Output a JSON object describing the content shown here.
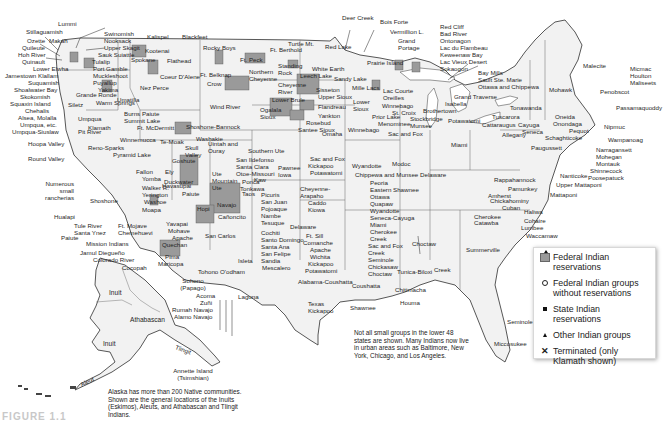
{
  "map": {
    "title": "Native American groups in the United States",
    "legend": {
      "items": [
        {
          "symbol": "federal-reservation-shaded-icon",
          "label": "Federal Indian reservations"
        },
        {
          "symbol": "open-circle-icon",
          "label": "Federal Indian groups without reservations"
        },
        {
          "symbol": "filled-square-icon",
          "label": "State Indian reservations"
        },
        {
          "symbol": "triangle-icon",
          "label": "Other Indian groups"
        },
        {
          "symbol": "x-mark-icon",
          "label": "Terminated (only Klamath shown)"
        }
      ]
    },
    "notes": {
      "lower48": "Not all small groups in the lower 48 states are shown. Many Indians now live in urban areas such as Baltimore, New York, Chicago, and Los Angeles.",
      "alaska": "Alaska has more than 200 Native communities. Shown are the general locations of the Inuits (Eskimos), Aleuts, and Athabascan and Tlingit Indians."
    },
    "figure_label": "FIGURE 1.1",
    "colors": {
      "land": "#f2f2f2",
      "reservation": "#9a9a9a",
      "border": "#555555",
      "text": "#1f1f1f"
    },
    "labels": {
      "northwest": [
        "Lummi",
        "Stillaguamish",
        "Ozette",
        "Makah",
        "Quileute",
        "Hoh River",
        "Quinault",
        "Lower Elwha",
        "Jamestown Klallam",
        "Suquamish",
        "Shoalwater Bay",
        "Skokomish",
        "Squaxin Island",
        "Chehalis",
        "Alsea, Molalla",
        "Umpqua, etc.",
        "Umpqua-Siuslaw",
        "Swinomish",
        "Nooksack",
        "Upper Skagit",
        "Sauk Suiattle",
        "Tulalip",
        "Port Gamble",
        "Muckleshoot",
        "Puyallup",
        "Yakima",
        "Grande Ronde",
        "Warm Springs",
        "Siletz",
        "Umatilla",
        "Nez Perce",
        "Kalispel",
        "Kootenai",
        "Spokane",
        "Flathead",
        "Coeur D'Alene",
        "Colville",
        "Burns Paiute",
        "Summit Lake",
        "Ft. McDermitt",
        "Klamath",
        "Pit River",
        "Umpqua"
      ],
      "california": [
        "Hoopa Valley",
        "Round Valley",
        "Numerous small rancherias",
        "Hualapi",
        "Tule River",
        "Santa Ynez",
        "Paiute",
        "Mission Indians",
        "Jamul Diegueño",
        "Colorado River",
        "Cocopah",
        "Shoshone",
        "Reno-Sparks",
        "Pyramid Lake",
        "Winnemucca",
        "Te-Moak",
        "Paiute",
        "Fallon",
        "Yomba",
        "Walker R.",
        "Yerington",
        "Washoe",
        "Ft. Mojave",
        "Chemehuevi",
        "Duckwater",
        "Ely",
        "Goshute"
      ],
      "southwest": [
        "Moapa",
        "Kaibab",
        "Havasupai",
        "Yavapai",
        "Mohave",
        "Apache",
        "Quechan",
        "Pima",
        "Maricopa",
        "Tohono O'odham",
        "Sohono (Papago)",
        "San Carlos",
        "Hopi",
        "Navajo",
        "Cañoncito",
        "Acoma",
        "Zuñi",
        "Rumah Navajo",
        "Alamo Navajo",
        "Laguna",
        "Isleta",
        "Mescalero",
        "Sandia",
        "San Felipe",
        "Santa Ana",
        "Santo Domingo",
        "Cochiti",
        "Tesuque",
        "Nambe",
        "Pojoaque",
        "San Juan",
        "Picuris",
        "Taos",
        "Santa Clara",
        "San Ildefonso",
        "Southern Ute",
        "Ute Mountain Ute",
        "Uintah and Ouray",
        "Skull Valley",
        "Paiute",
        "Shoshone-Bannock",
        "Washakie",
        "Wind River",
        "Jicarilla Apache"
      ],
      "plains": [
        "Blackfeet",
        "Rocky Boys",
        "Ft. Belknap",
        "Ft. Peck",
        "Crow",
        "Northern Cheyenne",
        "Ft. Berthold",
        "Turtle Mt.",
        "Standing Rock",
        "Cheyenne River",
        "Lower Brule",
        "Crow Creek",
        "Ogalala Sioux",
        "Rosebud",
        "Santee Sioux",
        "Flandreau",
        "Yankton",
        "Omaha",
        "Winnebago",
        "Sisseton",
        "Upper Sioux",
        "Lower Sioux",
        "Leech Lake",
        "White Earth",
        "Red Lake",
        "Sandy Lake",
        "Mille Lacs",
        "Otoe-Missouri",
        "Kaw",
        "Ponca",
        "Tonkawa",
        "Pawnee",
        "Iowa",
        "Sac and Fox",
        "Kickapoo",
        "Potawatomi",
        "Cheyenne-Arapaho",
        "Caddo",
        "Kiowa",
        "Delaware",
        "Ft. Sill",
        "Comanche",
        "Apache",
        "Wichita",
        "Kickapoo",
        "Potawatomi",
        "Texas Kickapoo",
        "Alabama-Coushatta"
      ],
      "great_lakes": [
        "Deer Creek",
        "Bois Forte",
        "Vermillion L.",
        "Grand Portage",
        "Prairie Island",
        "Red Cliff",
        "Bad River",
        "Ontonagon",
        "Lac du Flambeau",
        "Keweenaw Bay",
        "Lac Vieux Desert",
        "Sokaogon",
        "Bay Mills",
        "Sault Ste. Marie",
        "Ottawa and Chippewa",
        "Grand Traverse",
        "Isabella",
        "Potawatomi",
        "Lac Courte Oreilles",
        "Winnebago",
        "St. Croix",
        "Prior Lake",
        "Menominee",
        "Stockbridge Munsee",
        "Brothertown",
        "Sac and Fox",
        "Miami",
        "Wyandotte",
        "Chippewa and Munsee Delaware",
        "Peoria",
        "Eastern Shawnee",
        "Ottawa",
        "Quapaw",
        "Wyandotte",
        "Seneca-Cayuga",
        "Miami",
        "Cherokee",
        "Creek",
        "Sac and Fox",
        "Creek",
        "Seminole",
        "Chickasaw",
        "Choctaw",
        "Modoc"
      ],
      "northeast": [
        "Malecite",
        "Micmac",
        "Houlton",
        "Maliseets",
        "Passamaquoddy",
        "Penobscot",
        "Mohawk",
        "Tonawanda",
        "Tuscarora",
        "Cattaraugus",
        "Allegany",
        "Cayuga",
        "Seneca",
        "Oneida",
        "Onondaga",
        "Pequot",
        "Nipmuc",
        "Wampanoag",
        "Narragansett",
        "Mohegan",
        "Montauk",
        "Shinnecock",
        "Poosepatuck",
        "Schaghticoke",
        "Paugussett",
        "Nanticoke",
        "Upper Mattaponi",
        "Mattaponi",
        "Rappahannock",
        "Pamunkey",
        "Amherst",
        "Chickahominy",
        "Cuban",
        "Haliwa",
        "Cohaire",
        "Lumbee",
        "Waccamaw",
        "Cherokee",
        "Catawba",
        "Summerville"
      ],
      "southeast": [
        "Choctaw",
        "Tunica-Biloxi",
        "Chitimacha",
        "Houma",
        "Coushatta",
        "Shawnee",
        "Creek",
        "Seminole",
        "Miccosukee"
      ],
      "alaska": [
        "Inuit",
        "Athabascan",
        "Inuit",
        "Tlingit",
        "Aleut",
        "Annette Island (Tsimshian)"
      ]
    }
  }
}
